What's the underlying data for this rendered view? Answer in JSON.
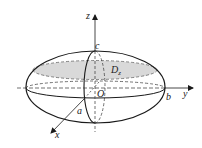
{
  "figure": {
    "type": "ellipsoid-cross-section",
    "colors": {
      "stroke": "#1a1a1a",
      "shade": "#d9d9d9",
      "background": "#ffffff"
    },
    "labels": {
      "z_axis": "z",
      "y_axis": "y",
      "x_axis": "x",
      "origin": "O",
      "semi_axis_c": "c",
      "semi_axis_a": "a",
      "semi_axis_b": "b",
      "region": "D",
      "region_subscript": "z"
    }
  }
}
